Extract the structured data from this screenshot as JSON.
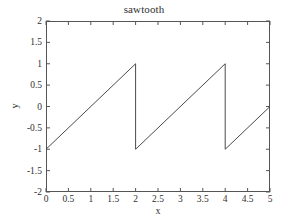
{
  "chart_data": {
    "type": "line",
    "title": "sawtooth",
    "xlabel": "x",
    "ylabel": "y",
    "xlim": [
      0,
      5
    ],
    "ylim": [
      -2,
      2
    ],
    "xticks": [
      0,
      0.5,
      1,
      1.5,
      2,
      2.5,
      3,
      3.5,
      4,
      4.5,
      5
    ],
    "xticklabels": [
      "0",
      "0.5",
      "1",
      "1.5",
      "2",
      "2.5",
      "3",
      "3.5",
      "4",
      "4.5",
      "5"
    ],
    "yticks": [
      2,
      1.5,
      1,
      0.5,
      0,
      -0.5,
      -1,
      -1.5,
      -2
    ],
    "yticklabels": [
      "2",
      "1.5",
      "1",
      "0.5",
      "0",
      "-0.5",
      "-1",
      "-1.5",
      "-2"
    ],
    "grid": false,
    "legend": null,
    "line_color": "#4a4a4a",
    "line_width": 1,
    "series": [
      {
        "name": "sawtooth",
        "period": 2,
        "amplitude": 1,
        "points": [
          [
            0,
            -1
          ],
          [
            2,
            1
          ],
          [
            2,
            -1
          ],
          [
            4,
            1
          ],
          [
            4,
            -1
          ],
          [
            5,
            0
          ]
        ]
      }
    ]
  }
}
